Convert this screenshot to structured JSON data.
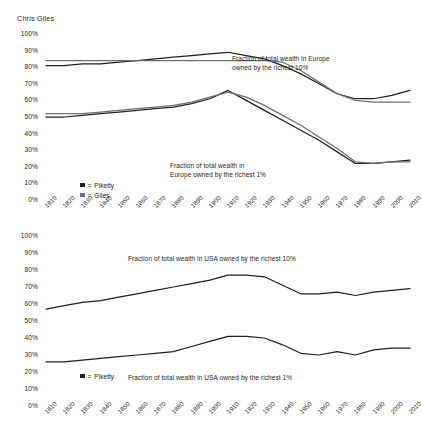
{
  "byline": "Chris Giles",
  "axis": {
    "y_ticks": [
      "100%",
      "90%",
      "80%",
      "70%",
      "60%",
      "50%",
      "40%",
      "30%",
      "20%",
      "10%",
      "0%"
    ],
    "x_ticks": [
      "1810",
      "1820",
      "1830",
      "1840",
      "1850",
      "1860",
      "1870",
      "1880",
      "1890",
      "1900",
      "1910",
      "1920",
      "1930",
      "1940",
      "1950",
      "1960",
      "1970",
      "1980",
      "1990",
      "2000",
      "2010"
    ]
  },
  "colors": {
    "piketty": "#231f20",
    "giles": "#6d6e71"
  },
  "panels": {
    "europe": {
      "annotation_top": "Fraction of total wealth in Europe\nowned by the richest 10%",
      "annotation_bottom": "Fraction of total wealth in\nEurope owned by the richest 1%",
      "legend": [
        {
          "label": "Piketty",
          "eq": "=",
          "color": "#231f20"
        },
        {
          "label": "Giles",
          "eq": "=",
          "color": "#6d6e71"
        }
      ]
    },
    "usa": {
      "annotation_top": "Fraction of total wealth in USA owned by the richest 10%",
      "annotation_bottom": "Fraction of total wealth in USA owned by the richest 1%",
      "legend": [
        {
          "label": "Piketty",
          "eq": "=",
          "color": "#231f20"
        }
      ]
    }
  },
  "chart_data": [
    {
      "type": "line",
      "title": "Fraction of total wealth in Europe owned by the richest 10% / 1%",
      "xlabel": "",
      "ylabel": "",
      "ylim": [
        0,
        100
      ],
      "grid": false,
      "legend_position": "inside-left",
      "x": [
        1810,
        1820,
        1830,
        1840,
        1850,
        1860,
        1870,
        1880,
        1890,
        1900,
        1910,
        1920,
        1930,
        1940,
        1950,
        1960,
        1970,
        1980,
        1990,
        2000,
        2010
      ],
      "series": [
        {
          "name": "Piketty - richest 10% (Europe)",
          "color": "#231f20",
          "values": [
            81,
            81,
            82,
            82,
            83,
            84,
            85,
            86,
            87,
            88,
            89,
            87,
            85,
            81,
            76,
            70,
            64,
            61,
            61,
            63,
            66
          ]
        },
        {
          "name": "Giles - richest 10% (Europe)",
          "color": "#6d6e71",
          "values": [
            84,
            84,
            84,
            84,
            84,
            84,
            84,
            84,
            84,
            84,
            84,
            84,
            84,
            83,
            78,
            71,
            64,
            60,
            59,
            59,
            59
          ]
        },
        {
          "name": "Piketty - richest 1% (Europe)",
          "color": "#231f20",
          "values": [
            50,
            50,
            51,
            52,
            53,
            54,
            55,
            56,
            58,
            61,
            66,
            60,
            54,
            48,
            42,
            36,
            29,
            22,
            22,
            23,
            24
          ]
        },
        {
          "name": "Giles - richest 1% (Europe)",
          "color": "#6d6e71",
          "values": [
            52,
            52,
            52,
            53,
            54,
            55,
            56,
            57,
            59,
            62,
            65,
            62,
            57,
            51,
            45,
            38,
            31,
            23,
            22,
            23,
            23
          ]
        }
      ]
    },
    {
      "type": "line",
      "title": "Fraction of total wealth in USA owned by the richest 10% / 1%",
      "xlabel": "",
      "ylabel": "",
      "ylim": [
        0,
        100
      ],
      "grid": false,
      "legend_position": "inside-left",
      "x": [
        1810,
        1820,
        1830,
        1840,
        1850,
        1860,
        1870,
        1880,
        1890,
        1900,
        1910,
        1920,
        1930,
        1940,
        1950,
        1960,
        1970,
        1980,
        1990,
        2000,
        2010
      ],
      "series": [
        {
          "name": "Piketty - richest 10% (USA)",
          "color": "#231f20",
          "values": [
            57,
            59,
            61,
            62,
            64,
            66,
            68,
            70,
            72,
            74,
            77,
            77,
            76,
            71,
            66,
            66,
            67,
            65,
            67,
            68,
            69
          ]
        },
        {
          "name": "Piketty - richest 1% (USA)",
          "color": "#231f20",
          "values": [
            26,
            26,
            27,
            28,
            29,
            30,
            31,
            32,
            35,
            38,
            41,
            41,
            40,
            36,
            31,
            30,
            32,
            30,
            33,
            34,
            34
          ]
        }
      ]
    }
  ]
}
